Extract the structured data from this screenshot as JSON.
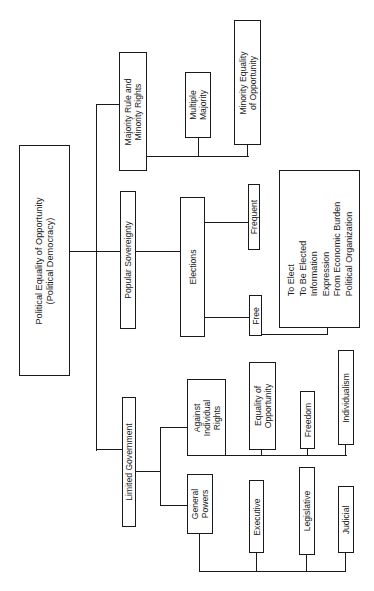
{
  "diagram": {
    "root": {
      "label": "Political Equality of Opportunity\n(Political Democracy)"
    },
    "branches": [
      {
        "label": "Majority Rule and\nMinority Rights",
        "children": [
          {
            "label": "Multiple\nMajority"
          },
          {
            "label": "Minority Equality\nof Opportunity"
          }
        ]
      },
      {
        "label": "Popular Sovereignty",
        "children": [
          {
            "label": "Elections",
            "children": [
              {
                "label": "Frequent"
              },
              {
                "label": "Free",
                "children": [
                  {
                    "label": "To Elect\nTo Be Elected\nInformation\nExpression\nFrom Economic Burden\nPolitical Organization"
                  }
                ]
              }
            ]
          }
        ]
      },
      {
        "label": "Limited Government",
        "children": [
          {
            "label": "Against\nIndividual\nRights",
            "children": [
              {
                "label": "Equality of\nOpportunity"
              },
              {
                "label": "Freedom"
              },
              {
                "label": "Individualism"
              }
            ]
          },
          {
            "label": "General\nPowers",
            "children": [
              {
                "label": "Executive"
              },
              {
                "label": "Legislative"
              },
              {
                "label": "Judicial"
              }
            ]
          }
        ]
      }
    ]
  },
  "colors": {
    "line": "#1a1a1a",
    "background": "#ffffff"
  }
}
